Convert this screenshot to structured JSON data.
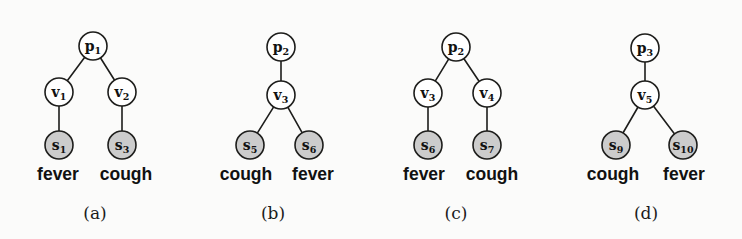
{
  "figure": {
    "background_color": "#fbfbfa",
    "node_open_color": "#ffffff",
    "node_shaded_color": "#cccccc",
    "stroke_color": "#1d1d1b",
    "panels": [
      {
        "caption": "(a)",
        "caption_x": 95,
        "nodes": [
          {
            "id": "p1",
            "base": "p",
            "sub": "1",
            "x": 93,
            "y": 46,
            "r": 14,
            "shaded": false
          },
          {
            "id": "v1",
            "base": "v",
            "sub": "1",
            "x": 59,
            "y": 92,
            "r": 14,
            "shaded": false
          },
          {
            "id": "v2",
            "base": "v",
            "sub": "2",
            "x": 122,
            "y": 92,
            "r": 14,
            "shaded": false
          },
          {
            "id": "s1",
            "base": "s",
            "sub": "1",
            "x": 59,
            "y": 145,
            "r": 14,
            "shaded": true
          },
          {
            "id": "s3",
            "base": "s",
            "sub": "3",
            "x": 122,
            "y": 145,
            "r": 14,
            "shaded": true
          }
        ],
        "edges": [
          {
            "from": "p1",
            "to": "v1"
          },
          {
            "from": "p1",
            "to": "v2"
          },
          {
            "from": "v1",
            "to": "s1"
          },
          {
            "from": "v2",
            "to": "s3"
          }
        ],
        "words": [
          {
            "text": "fever",
            "x": 58,
            "y": 180
          },
          {
            "text": "cough",
            "x": 126,
            "y": 180
          }
        ]
      },
      {
        "caption": "(b)",
        "caption_x": 273,
        "nodes": [
          {
            "id": "p2",
            "base": "p",
            "sub": "2",
            "x": 281,
            "y": 47,
            "r": 14,
            "shaded": false
          },
          {
            "id": "v3",
            "base": "v",
            "sub": "3",
            "x": 281,
            "y": 95,
            "r": 14,
            "shaded": false
          },
          {
            "id": "s5",
            "base": "s",
            "sub": "5",
            "x": 250,
            "y": 145,
            "r": 14,
            "shaded": true
          },
          {
            "id": "s6",
            "base": "s",
            "sub": "6",
            "x": 309,
            "y": 145,
            "r": 14,
            "shaded": true
          }
        ],
        "edges": [
          {
            "from": "p2",
            "to": "v3"
          },
          {
            "from": "v3",
            "to": "s5"
          },
          {
            "from": "v3",
            "to": "s6"
          }
        ],
        "words": [
          {
            "text": "cough",
            "x": 246,
            "y": 180
          },
          {
            "text": "fever",
            "x": 313,
            "y": 180
          }
        ]
      },
      {
        "caption": "(c)",
        "caption_x": 456,
        "nodes": [
          {
            "id": "p2c",
            "base": "p",
            "sub": "2",
            "x": 456,
            "y": 47,
            "r": 14,
            "shaded": false
          },
          {
            "id": "v3c",
            "base": "v",
            "sub": "3",
            "x": 428,
            "y": 93,
            "r": 14,
            "shaded": false
          },
          {
            "id": "v4c",
            "base": "v",
            "sub": "4",
            "x": 487,
            "y": 93,
            "r": 14,
            "shaded": false
          },
          {
            "id": "s6c",
            "base": "s",
            "sub": "6",
            "x": 428,
            "y": 145,
            "r": 14,
            "shaded": true
          },
          {
            "id": "s7c",
            "base": "s",
            "sub": "7",
            "x": 487,
            "y": 145,
            "r": 14,
            "shaded": true
          }
        ],
        "edges": [
          {
            "from": "p2c",
            "to": "v3c"
          },
          {
            "from": "p2c",
            "to": "v4c"
          },
          {
            "from": "v3c",
            "to": "s6c"
          },
          {
            "from": "v4c",
            "to": "s7c"
          }
        ],
        "words": [
          {
            "text": "fever",
            "x": 424,
            "y": 180
          },
          {
            "text": "cough",
            "x": 492,
            "y": 180
          }
        ]
      },
      {
        "caption": "(d)",
        "caption_x": 646,
        "nodes": [
          {
            "id": "p3",
            "base": "p",
            "sub": "3",
            "x": 645,
            "y": 48,
            "r": 14,
            "shaded": false
          },
          {
            "id": "v5",
            "base": "v",
            "sub": "5",
            "x": 645,
            "y": 95,
            "r": 14,
            "shaded": false
          },
          {
            "id": "s9",
            "base": "s",
            "sub": "9",
            "x": 616,
            "y": 145,
            "r": 14,
            "shaded": true
          },
          {
            "id": "s10",
            "base": "s",
            "sub": "10",
            "x": 683,
            "y": 145,
            "r": 14,
            "shaded": true
          }
        ],
        "edges": [
          {
            "from": "p3",
            "to": "v5"
          },
          {
            "from": "v5",
            "to": "s9"
          },
          {
            "from": "v5",
            "to": "s10"
          }
        ],
        "words": [
          {
            "text": "cough",
            "x": 613,
            "y": 180
          },
          {
            "text": "fever",
            "x": 684,
            "y": 180
          }
        ]
      }
    ]
  }
}
